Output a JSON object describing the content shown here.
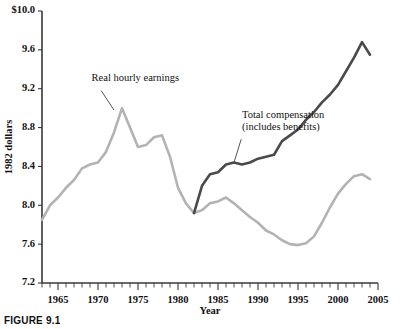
{
  "figure": {
    "caption": "FIGURE 9.1"
  },
  "chart_data": {
    "type": "line",
    "title": "",
    "xlabel": "Year",
    "ylabel": "1982 dollars",
    "xlim": [
      1963,
      2005
    ],
    "ylim": [
      7.2,
      10.0
    ],
    "grid": false,
    "legend_position": "inline-annotations",
    "ytick_labels": [
      "7.2",
      "7.6",
      "8.0",
      "8.4",
      "8.8",
      "9.2",
      "9.6",
      "$10.0"
    ],
    "ytick_values": [
      7.2,
      7.6,
      8.0,
      8.4,
      8.8,
      9.2,
      9.6,
      10.0
    ],
    "xtick_labels": [
      "1965",
      "1970",
      "1975",
      "1980",
      "1985",
      "1990",
      "1995",
      "2000",
      "2005"
    ],
    "xtick_values": [
      1965,
      1970,
      1975,
      1980,
      1985,
      1990,
      1995,
      2000,
      2005
    ],
    "xtick_minor_step": 1,
    "annotations": [
      {
        "name": "real-hourly-earnings-label",
        "text": "Real hourly earnings",
        "text_x": 1969.2,
        "text_y": 9.28,
        "leader_from": [
          1970.4,
          9.18
        ],
        "leader_to": [
          1972.0,
          8.98
        ]
      },
      {
        "name": "total-compensation-label",
        "line1": "Total compensation",
        "line2": "(includes benefits)",
        "text_x": 1988.0,
        "text_y": 8.9,
        "leader_from": [
          1987.9,
          8.68
        ],
        "leader_to": [
          1987.0,
          8.44
        ]
      }
    ],
    "series": [
      {
        "name": "Real hourly earnings",
        "color": "#b3b3b3",
        "x": [
          1963,
          1964,
          1965,
          1966,
          1967,
          1968,
          1969,
          1970,
          1971,
          1972,
          1973,
          1974,
          1975,
          1976,
          1977,
          1978,
          1979,
          1980,
          1981,
          1982,
          1983,
          1984,
          1985,
          1986,
          1987,
          1988,
          1989,
          1990,
          1991,
          1992,
          1993,
          1994,
          1995,
          1996,
          1997,
          1998,
          1999,
          2000,
          2001,
          2002,
          2003,
          2004
        ],
        "values": [
          7.85,
          8.0,
          8.08,
          8.18,
          8.26,
          8.38,
          8.42,
          8.44,
          8.55,
          8.75,
          9.0,
          8.8,
          8.6,
          8.62,
          8.7,
          8.72,
          8.5,
          8.18,
          8.02,
          7.92,
          7.95,
          8.02,
          8.04,
          8.08,
          8.02,
          7.95,
          7.88,
          7.82,
          7.74,
          7.7,
          7.64,
          7.6,
          7.59,
          7.61,
          7.68,
          7.82,
          7.98,
          8.12,
          8.22,
          8.3,
          8.32,
          8.27
        ]
      },
      {
        "name": "Total compensation (includes benefits)",
        "color": "#4a4a4a",
        "x": [
          1982,
          1983,
          1984,
          1985,
          1986,
          1987,
          1988,
          1989,
          1990,
          1991,
          1992,
          1993,
          1994,
          1995,
          1996,
          1997,
          1998,
          1999,
          2000,
          2001,
          2002,
          2003,
          2004
        ],
        "values": [
          7.92,
          8.2,
          8.32,
          8.34,
          8.42,
          8.44,
          8.42,
          8.44,
          8.48,
          8.5,
          8.52,
          8.66,
          8.72,
          8.78,
          8.88,
          8.96,
          9.06,
          9.14,
          9.24,
          9.38,
          9.52,
          9.68,
          9.55
        ]
      }
    ]
  }
}
